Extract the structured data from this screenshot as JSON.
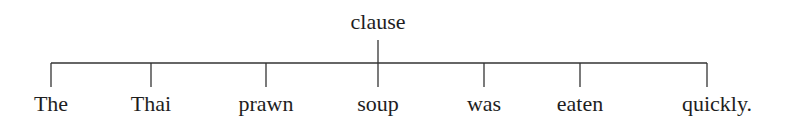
{
  "diagram": {
    "type": "constituency-tree",
    "root": {
      "label": "clause",
      "x": 378
    },
    "bar_y": 63,
    "stem_top": 40,
    "tick_bottom": 87,
    "leaves": [
      {
        "label": "The",
        "x": 51,
        "text_x": 51
      },
      {
        "label": "Thai",
        "x": 151,
        "text_x": 151
      },
      {
        "label": "prawn",
        "x": 266,
        "text_x": 266
      },
      {
        "label": "soup",
        "x": 378,
        "text_x": 378
      },
      {
        "label": "was",
        "x": 484,
        "text_x": 484
      },
      {
        "label": "eaten",
        "x": 580,
        "text_x": 580
      },
      {
        "label": "quickly.",
        "x": 707,
        "text_x": 717
      }
    ]
  }
}
